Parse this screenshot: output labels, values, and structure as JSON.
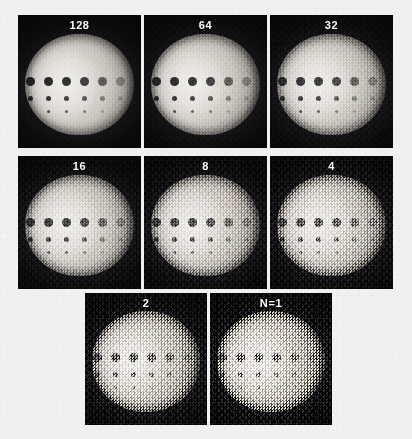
{
  "figure": {
    "type": "image-panel-grid",
    "background_color": "#f1f0ee",
    "panel_background_color": "#0b0b0c",
    "label_color": "#fbfbfb",
    "rows": [
      {
        "row_index": 1,
        "panels": [
          {
            "label": "128",
            "n_value": 128,
            "noise_level": 0.08,
            "noise_level_fine": 0.05
          },
          {
            "label": "64",
            "n_value": 64,
            "noise_level": 0.13,
            "noise_level_fine": 0.08
          },
          {
            "label": "32",
            "n_value": 32,
            "noise_level": 0.2,
            "noise_level_fine": 0.12
          }
        ]
      },
      {
        "row_index": 2,
        "panels": [
          {
            "label": "16",
            "n_value": 16,
            "noise_level": 0.3,
            "noise_level_fine": 0.18
          },
          {
            "label": "8",
            "n_value": 8,
            "noise_level": 0.42,
            "noise_level_fine": 0.26
          },
          {
            "label": "4",
            "n_value": 4,
            "noise_level": 0.56,
            "noise_level_fine": 0.34
          }
        ]
      },
      {
        "row_index": 3,
        "panels": [
          {
            "label": "2",
            "n_value": 2,
            "noise_level": 0.72,
            "noise_level_fine": 0.44
          },
          {
            "label": "N=1",
            "n_value": 1,
            "noise_level": 0.88,
            "noise_level_fine": 0.55
          }
        ]
      }
    ],
    "lesion_pattern": {
      "description": "Each phantom contains three horizontal rows of six cold spots; spot diameter decreases with row and contrast decreases left to right.",
      "rows": [
        {
          "size": "large",
          "count": 6,
          "opacities": [
            0.95,
            0.92,
            0.88,
            0.8,
            0.62,
            0.34
          ]
        },
        {
          "size": "medium",
          "count": 6,
          "opacities": [
            0.9,
            0.86,
            0.78,
            0.66,
            0.44,
            0.2
          ]
        },
        {
          "size": "small",
          "count": 6,
          "opacities": [
            0.82,
            0.74,
            0.62,
            0.48,
            0.28,
            0.12
          ]
        }
      ]
    },
    "caption_fragment": ""
  }
}
